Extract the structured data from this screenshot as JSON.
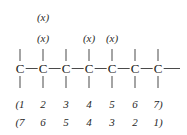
{
  "diagram": {
    "type": "chemical-structure",
    "backbone": {
      "atom_label": "C",
      "atom_count": 7,
      "atom_x": [
        20,
        43,
        66,
        89,
        112,
        135,
        158
      ],
      "atom_y": 68,
      "tail_bond_end_x": 180,
      "head_bond_start_x": 20
    },
    "substituents": [
      {
        "label": "(x)",
        "carbon_index": 2,
        "x": 43,
        "y": 12
      },
      {
        "label": "(x)",
        "carbon_index": 2,
        "x": 43,
        "y": 33
      },
      {
        "label": "(x)",
        "carbon_index": 4,
        "x": 89,
        "y": 33
      },
      {
        "label": "(x)",
        "carbon_index": 5,
        "x": 112,
        "y": 33
      }
    ],
    "numbering": {
      "row_top": {
        "name": "forward-numbering",
        "cells": [
          "(1",
          "2",
          "3",
          "4",
          "5",
          "6",
          "7)"
        ],
        "y": 99
      },
      "row_bottom": {
        "name": "reverse-numbering",
        "cells": [
          "(7",
          "6",
          "5",
          "4",
          "3",
          "2",
          "1)"
        ],
        "y": 117
      }
    }
  },
  "colors": {
    "background": "#ffffff",
    "ink": "#1c1c1c",
    "bond": "#4a4a4a"
  }
}
